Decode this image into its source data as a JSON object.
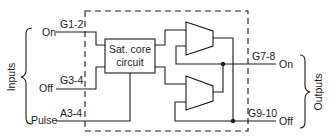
{
  "diagram": {
    "title": "",
    "groups": {
      "inputs_label": "Inputs",
      "outputs_label": "Outputs"
    },
    "inputs": [
      {
        "label": "On",
        "pin": "G1-2"
      },
      {
        "label": "Off",
        "pin": "G3-4"
      },
      {
        "label": "Pulse",
        "pin": "A3-4"
      }
    ],
    "outputs": [
      {
        "label": "On",
        "pin": "G7-8"
      },
      {
        "label": "Off",
        "pin": "G9-10"
      }
    ],
    "blocks": {
      "core_line1": "Sat. core",
      "core_line2": "circuit"
    },
    "components": [
      "saturable-core-circuit",
      "amplifier-upper",
      "amplifier-lower"
    ],
    "colors": {
      "line": "#1a1a1a",
      "background": "#ffffff"
    }
  }
}
